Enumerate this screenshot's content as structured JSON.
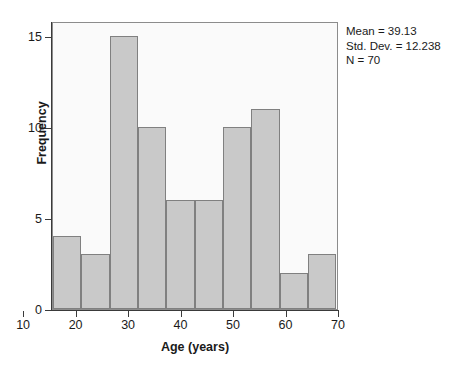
{
  "chart_data": {
    "type": "bar",
    "title": "",
    "subtitle": "",
    "xlabel": "Age (years)",
    "ylabel": "Frequency",
    "xlim": [
      15.5,
      70.0
    ],
    "ylim": [
      0,
      15.8
    ],
    "grid": false,
    "legend": "none",
    "bin_width": 5.4,
    "categories": [
      "15.5-20.9",
      "20.9-26.3",
      "26.3-31.7",
      "31.7-37.1",
      "37.1-42.5",
      "42.5-47.9",
      "47.9-53.3",
      "53.3-58.7",
      "58.7-64.1",
      "64.1-69.5"
    ],
    "bin_edges": [
      15.5,
      20.9,
      26.3,
      31.7,
      37.1,
      42.5,
      47.9,
      53.3,
      58.7,
      64.1,
      69.5
    ],
    "values": [
      4,
      3,
      15,
      10,
      6,
      6,
      10,
      11,
      2,
      3
    ],
    "xticks": [
      10,
      20,
      30,
      40,
      50,
      60,
      70
    ],
    "xtick_labels": [
      "10",
      "20",
      "30",
      "40",
      "50",
      "60",
      "70"
    ],
    "yticks": [
      0,
      5,
      10,
      15
    ],
    "ytick_labels": [
      "0",
      "5",
      "10",
      "15"
    ],
    "annotations": [
      "Mean = 39.13",
      "Std. Dev. = 12.238",
      "N = 70"
    ],
    "colors": {
      "bar_fill": "#c9c9c9",
      "bar_edge": "#808080",
      "plot_background": "#fafafa",
      "frame": "#8c8c8c",
      "axis": "#3a3a3a",
      "text": "#1a1a1a"
    }
  },
  "stats": {
    "mean_line": "Mean = 39.13",
    "stddev_line": "Std. Dev. = 12.238",
    "n_line": "N = 70"
  }
}
